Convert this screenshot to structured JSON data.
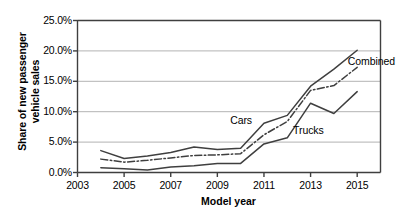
{
  "chart_data": {
    "type": "line",
    "title": "",
    "xlabel": "Model year",
    "ylabel": "Share of new passenger vehicle sales",
    "ylabel_lines": [
      "Share of new passenger",
      "vehicle sales"
    ],
    "xlim": [
      2003,
      2016
    ],
    "ylim": [
      0,
      25
    ],
    "x_ticks": [
      2003,
      2005,
      2007,
      2009,
      2011,
      2013,
      2015
    ],
    "x_ticklabels": [
      "2003",
      "2005",
      "2007",
      "2009",
      "2011",
      "2013",
      "2015"
    ],
    "y_ticks": [
      0,
      5,
      10,
      15,
      20,
      25
    ],
    "y_ticklabels": [
      "0.0%",
      "5.0%",
      "10.0%",
      "15.0%",
      "20.0%",
      "25.0%"
    ],
    "grid": "horizontal",
    "grid_color": "#b3b3b3",
    "axis_color": "#3f3f3f",
    "legend_position": "inline-annotations",
    "x": [
      2004,
      2005,
      2006,
      2007,
      2008,
      2009,
      2010,
      2011,
      2012,
      2013,
      2014,
      2015
    ],
    "series": [
      {
        "name": "Cars",
        "style": "solid",
        "color": "#3f3f3f",
        "values": [
          3.6,
          2.3,
          2.7,
          3.3,
          4.2,
          3.8,
          4.0,
          8.1,
          9.4,
          14.2,
          17.0,
          20.1
        ]
      },
      {
        "name": "Combined",
        "style": "dash-dot",
        "color": "#3f3f3f",
        "values": [
          2.2,
          1.7,
          2.0,
          2.4,
          2.8,
          2.9,
          3.1,
          6.2,
          8.4,
          13.5,
          14.3,
          17.3
        ]
      },
      {
        "name": "Trucks",
        "style": "solid",
        "color": "#3f3f3f",
        "values": [
          0.8,
          0.6,
          0.4,
          0.9,
          1.1,
          1.5,
          1.5,
          4.7,
          5.7,
          11.4,
          9.7,
          13.3
        ]
      }
    ],
    "annotations": [
      {
        "text": "Cars",
        "x": 2009.55,
        "y": 8.55
      },
      {
        "text": "Trucks",
        "x": 2012.25,
        "y": 6.9
      },
      {
        "text": "Combined",
        "x": 2014.6,
        "y": 18.2
      }
    ]
  }
}
